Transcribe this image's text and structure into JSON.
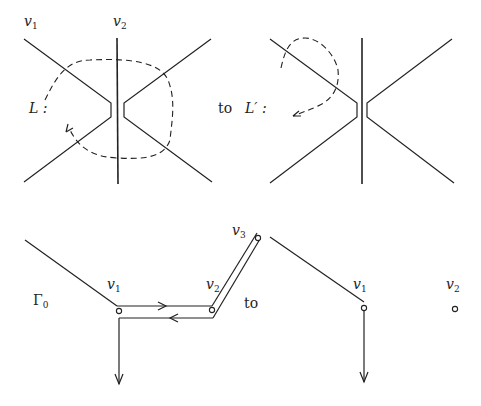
{
  "top_left": {
    "vertex_labels": [
      {
        "base": "v",
        "sub": "1"
      },
      {
        "base": "v",
        "sub": "2"
      }
    ],
    "loop_label": "L :"
  },
  "connector_top": "to",
  "top_right": {
    "loop_label": "L′ :"
  },
  "bottom_left": {
    "graph_label": {
      "base": "Γ",
      "sub": "0"
    },
    "vertex_labels": [
      {
        "base": "v",
        "sub": "1"
      },
      {
        "base": "v",
        "sub": "2"
      },
      {
        "base": "v",
        "sub": "3"
      }
    ]
  },
  "connector_bottom": "to",
  "bottom_right": {
    "vertex_labels": [
      {
        "base": "v",
        "sub": "1"
      },
      {
        "base": "v",
        "sub": "2"
      }
    ]
  }
}
